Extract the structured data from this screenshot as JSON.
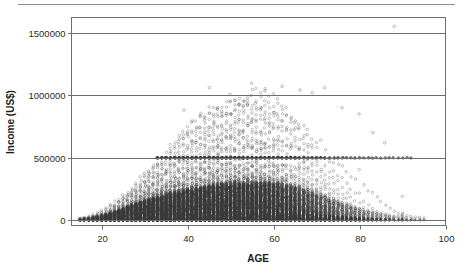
{
  "figure": {
    "background_color": "#ffffff",
    "rule_color": "#8f8f8f",
    "frame_color": "#6d6d6d",
    "point_color": "#3a3a3a"
  },
  "chart_data": {
    "type": "scatter",
    "title": "",
    "subtitle": "",
    "xlabel": "AGE",
    "ylabel": "Income (US$)",
    "xlim": [
      13,
      100
    ],
    "ylim": [
      -40000,
      1620000
    ],
    "xticks": [
      20,
      40,
      60,
      80,
      100
    ],
    "xticklabels": [
      "20",
      "40",
      "60",
      "80",
      "100"
    ],
    "yticks": [
      0,
      500000,
      1000000,
      1500000
    ],
    "yticklabels": [
      "0",
      "500000",
      "1000000",
      "1500000"
    ],
    "grid": "horizontal",
    "legend": "none",
    "marker": "open-circle",
    "marker_size": 2.0,
    "columns": [
      {
        "age": 15,
        "n": 18,
        "p50": 4000,
        "p90": 14000,
        "max": 26000
      },
      {
        "age": 16,
        "n": 26,
        "p50": 5000,
        "p90": 17000,
        "max": 32000
      },
      {
        "age": 17,
        "n": 34,
        "p50": 6000,
        "p90": 20000,
        "max": 40000
      },
      {
        "age": 18,
        "n": 48,
        "p50": 8000,
        "p90": 26000,
        "max": 52000
      },
      {
        "age": 19,
        "n": 62,
        "p50": 10000,
        "p90": 32000,
        "max": 66000
      },
      {
        "age": 20,
        "n": 80,
        "p50": 12000,
        "p90": 40000,
        "max": 86000
      },
      {
        "age": 21,
        "n": 96,
        "p50": 15000,
        "p90": 48000,
        "max": 104000
      },
      {
        "age": 22,
        "n": 118,
        "p50": 18000,
        "p90": 58000,
        "max": 128000
      },
      {
        "age": 23,
        "n": 140,
        "p50": 21000,
        "p90": 68000,
        "max": 150000
      },
      {
        "age": 24,
        "n": 162,
        "p50": 24000,
        "p90": 80000,
        "max": 176000
      },
      {
        "age": 25,
        "n": 186,
        "p50": 28000,
        "p90": 92000,
        "max": 205000
      },
      {
        "age": 26,
        "n": 208,
        "p50": 31000,
        "p90": 104000,
        "max": 232000
      },
      {
        "age": 27,
        "n": 230,
        "p50": 34000,
        "p90": 116000,
        "max": 262000
      },
      {
        "age": 28,
        "n": 252,
        "p50": 37000,
        "p90": 128000,
        "max": 300000
      },
      {
        "age": 29,
        "n": 272,
        "p50": 40000,
        "p90": 140000,
        "max": 340000
      },
      {
        "age": 30,
        "n": 292,
        "p50": 43000,
        "p90": 152000,
        "max": 380000
      },
      {
        "age": 31,
        "n": 308,
        "p50": 46000,
        "p90": 163000,
        "max": 420000
      },
      {
        "age": 32,
        "n": 322,
        "p50": 48000,
        "p90": 173000,
        "max": 455000
      },
      {
        "age": 33,
        "n": 336,
        "p50": 51000,
        "p90": 183000,
        "max": 500000
      },
      {
        "age": 34,
        "n": 348,
        "p50": 53000,
        "p90": 192000,
        "max": 520000
      },
      {
        "age": 35,
        "n": 360,
        "p50": 55000,
        "p90": 200000,
        "max": 560000
      },
      {
        "age": 36,
        "n": 372,
        "p50": 57000,
        "p90": 208000,
        "max": 600000
      },
      {
        "age": 37,
        "n": 382,
        "p50": 59000,
        "p90": 216000,
        "max": 640000
      },
      {
        "age": 38,
        "n": 392,
        "p50": 61000,
        "p90": 223000,
        "max": 680000
      },
      {
        "age": 39,
        "n": 400,
        "p50": 62000,
        "p90": 230000,
        "max": 720000
      },
      {
        "age": 40,
        "n": 408,
        "p50": 64000,
        "p90": 237000,
        "max": 760000
      },
      {
        "age": 41,
        "n": 416,
        "p50": 65000,
        "p90": 243000,
        "max": 790000
      },
      {
        "age": 42,
        "n": 422,
        "p50": 67000,
        "p90": 249000,
        "max": 820000
      },
      {
        "age": 43,
        "n": 428,
        "p50": 68000,
        "p90": 255000,
        "max": 850000
      },
      {
        "age": 44,
        "n": 434,
        "p50": 69000,
        "p90": 260000,
        "max": 880000
      },
      {
        "age": 45,
        "n": 438,
        "p50": 70000,
        "p90": 265000,
        "max": 900000
      },
      {
        "age": 46,
        "n": 442,
        "p50": 71000,
        "p90": 270000,
        "max": 920000
      },
      {
        "age": 47,
        "n": 446,
        "p50": 72000,
        "p90": 274000,
        "max": 940000
      },
      {
        "age": 48,
        "n": 448,
        "p50": 72500,
        "p90": 278000,
        "max": 960000
      },
      {
        "age": 49,
        "n": 450,
        "p50": 73000,
        "p90": 282000,
        "max": 980000
      },
      {
        "age": 50,
        "n": 450,
        "p50": 73500,
        "p90": 285000,
        "max": 1000000
      },
      {
        "age": 51,
        "n": 448,
        "p50": 74000,
        "p90": 288000,
        "max": 1010000
      },
      {
        "age": 52,
        "n": 446,
        "p50": 74000,
        "p90": 290000,
        "max": 1020000
      },
      {
        "age": 53,
        "n": 442,
        "p50": 74000,
        "p90": 292000,
        "max": 1030000
      },
      {
        "age": 54,
        "n": 438,
        "p50": 73500,
        "p90": 293000,
        "max": 1040000
      },
      {
        "age": 55,
        "n": 432,
        "p50": 73000,
        "p90": 294000,
        "max": 1050000
      },
      {
        "age": 56,
        "n": 424,
        "p50": 72500,
        "p90": 294000,
        "max": 1050000
      },
      {
        "age": 57,
        "n": 414,
        "p50": 72000,
        "p90": 293000,
        "max": 1040000
      },
      {
        "age": 58,
        "n": 402,
        "p50": 71000,
        "p90": 292000,
        "max": 1030000
      },
      {
        "age": 59,
        "n": 388,
        "p50": 70000,
        "p90": 290000,
        "max": 1020000
      },
      {
        "age": 60,
        "n": 372,
        "p50": 69000,
        "p90": 287000,
        "max": 1000000
      },
      {
        "age": 61,
        "n": 354,
        "p50": 67000,
        "p90": 283000,
        "max": 980000
      },
      {
        "age": 62,
        "n": 334,
        "p50": 65000,
        "p90": 278000,
        "max": 950000
      },
      {
        "age": 63,
        "n": 312,
        "p50": 63000,
        "p90": 272000,
        "max": 920000
      },
      {
        "age": 64,
        "n": 290,
        "p50": 61000,
        "p90": 265000,
        "max": 890000
      },
      {
        "age": 65,
        "n": 266,
        "p50": 58000,
        "p90": 257000,
        "max": 860000
      },
      {
        "age": 66,
        "n": 242,
        "p50": 55000,
        "p90": 248000,
        "max": 830000
      },
      {
        "age": 67,
        "n": 218,
        "p50": 52000,
        "p90": 238000,
        "max": 800000
      },
      {
        "age": 68,
        "n": 196,
        "p50": 49000,
        "p90": 228000,
        "max": 760000
      },
      {
        "age": 69,
        "n": 176,
        "p50": 46000,
        "p90": 217000,
        "max": 720000
      },
      {
        "age": 70,
        "n": 158,
        "p50": 43000,
        "p90": 206000,
        "max": 680000
      },
      {
        "age": 71,
        "n": 140,
        "p50": 40000,
        "p90": 194000,
        "max": 640000
      },
      {
        "age": 72,
        "n": 124,
        "p50": 37000,
        "p90": 182000,
        "max": 600000
      },
      {
        "age": 73,
        "n": 110,
        "p50": 35000,
        "p90": 170000,
        "max": 560000
      },
      {
        "age": 74,
        "n": 96,
        "p50": 32000,
        "p90": 158000,
        "max": 520000
      },
      {
        "age": 75,
        "n": 84,
        "p50": 30000,
        "p90": 146000,
        "max": 500000
      },
      {
        "age": 76,
        "n": 72,
        "p50": 28000,
        "p90": 135000,
        "max": 480000
      },
      {
        "age": 77,
        "n": 62,
        "p50": 26000,
        "p90": 124000,
        "max": 450000
      },
      {
        "age": 78,
        "n": 54,
        "p50": 24000,
        "p90": 113000,
        "max": 420000
      },
      {
        "age": 79,
        "n": 46,
        "p50": 22000,
        "p90": 103000,
        "max": 400000
      },
      {
        "age": 80,
        "n": 40,
        "p50": 20000,
        "p90": 94000,
        "max": 500000
      },
      {
        "age": 81,
        "n": 34,
        "p50": 19000,
        "p90": 86000,
        "max": 380000
      },
      {
        "age": 82,
        "n": 28,
        "p50": 17000,
        "p90": 78000,
        "max": 350000
      },
      {
        "age": 83,
        "n": 24,
        "p50": 16000,
        "p90": 71000,
        "max": 330000
      },
      {
        "age": 84,
        "n": 20,
        "p50": 15000,
        "p90": 64000,
        "max": 300000
      },
      {
        "age": 85,
        "n": 17,
        "p50": 14000,
        "p90": 58000,
        "max": 280000
      },
      {
        "age": 86,
        "n": 14,
        "p50": 13000,
        "p90": 52000,
        "max": 250000
      },
      {
        "age": 87,
        "n": 12,
        "p50": 12000,
        "p90": 47000,
        "max": 230000
      },
      {
        "age": 88,
        "n": 10,
        "p50": 11000,
        "p90": 42000,
        "max": 200000
      },
      {
        "age": 89,
        "n": 8,
        "p50": 10000,
        "p90": 38000,
        "max": 180000
      },
      {
        "age": 90,
        "n": 14,
        "p50": 12000,
        "p90": 60000,
        "max": 420000
      },
      {
        "age": 91,
        "n": 6,
        "p50": 9000,
        "p90": 34000,
        "max": 160000
      },
      {
        "age": 92,
        "n": 5,
        "p50": 8500,
        "p90": 31000,
        "max": 140000
      },
      {
        "age": 93,
        "n": 4,
        "p50": 8000,
        "p90": 28000,
        "max": 120000
      },
      {
        "age": 94,
        "n": 4,
        "p50": 7500,
        "p90": 26000,
        "max": 110000
      },
      {
        "age": 95,
        "n": 3,
        "p50": 7000,
        "p90": 24000,
        "max": 100000
      }
    ],
    "topcode_band": {
      "income": 500000,
      "age_range": [
        33,
        92
      ],
      "density": "high"
    },
    "outliers": [
      {
        "age": 88,
        "income": 1550000
      },
      {
        "age": 45,
        "income": 1060000
      },
      {
        "age": 62,
        "income": 1070000
      },
      {
        "age": 72,
        "income": 1060000
      },
      {
        "age": 55,
        "income": 1045000
      },
      {
        "age": 58,
        "income": 1035000
      },
      {
        "age": 66,
        "income": 1040000
      },
      {
        "age": 69,
        "income": 1020000
      },
      {
        "age": 39,
        "income": 880000
      },
      {
        "age": 52,
        "income": 930000
      },
      {
        "age": 76,
        "income": 900000
      },
      {
        "age": 80,
        "income": 850000
      },
      {
        "age": 83,
        "income": 700000
      },
      {
        "age": 86,
        "income": 620000
      }
    ]
  }
}
